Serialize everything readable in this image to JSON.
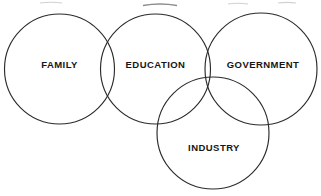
{
  "diagram": {
    "type": "venn-diagram",
    "title": "",
    "background_color": "#ffffff",
    "stroke_color": "#2b2b2b",
    "label_color": "#161616",
    "circles": [
      {
        "id": "family",
        "label": "FAMILY",
        "cx": 59.5,
        "cy": 69,
        "r": 55,
        "label_x": 59.5,
        "label_y": 65
      },
      {
        "id": "education",
        "label": "EDUCATION",
        "cx": 155.5,
        "cy": 69,
        "r": 55,
        "label_x": 155.5,
        "label_y": 65
      },
      {
        "id": "government",
        "label": "GOVERNMENT",
        "cx": 261,
        "cy": 69,
        "r": 56,
        "label_x": 263,
        "label_y": 65
      },
      {
        "id": "industry",
        "label": "INDUSTRY",
        "cx": 213,
        "cy": 133,
        "r": 56,
        "label_x": 214,
        "label_y": 148
      }
    ],
    "artifacts": [
      {
        "id": "top-smudge-left",
        "x": 40,
        "y": 2,
        "width": 22,
        "tone": "light"
      },
      {
        "id": "top-smudge-center",
        "x": 143,
        "y": 4,
        "width": 34,
        "tone": "dark"
      },
      {
        "id": "top-smudge-right",
        "x": 228,
        "y": 3,
        "width": 20,
        "tone": "light"
      },
      {
        "id": "top-smudge-far-right",
        "x": 278,
        "y": 2,
        "width": 18,
        "tone": "light"
      }
    ]
  }
}
